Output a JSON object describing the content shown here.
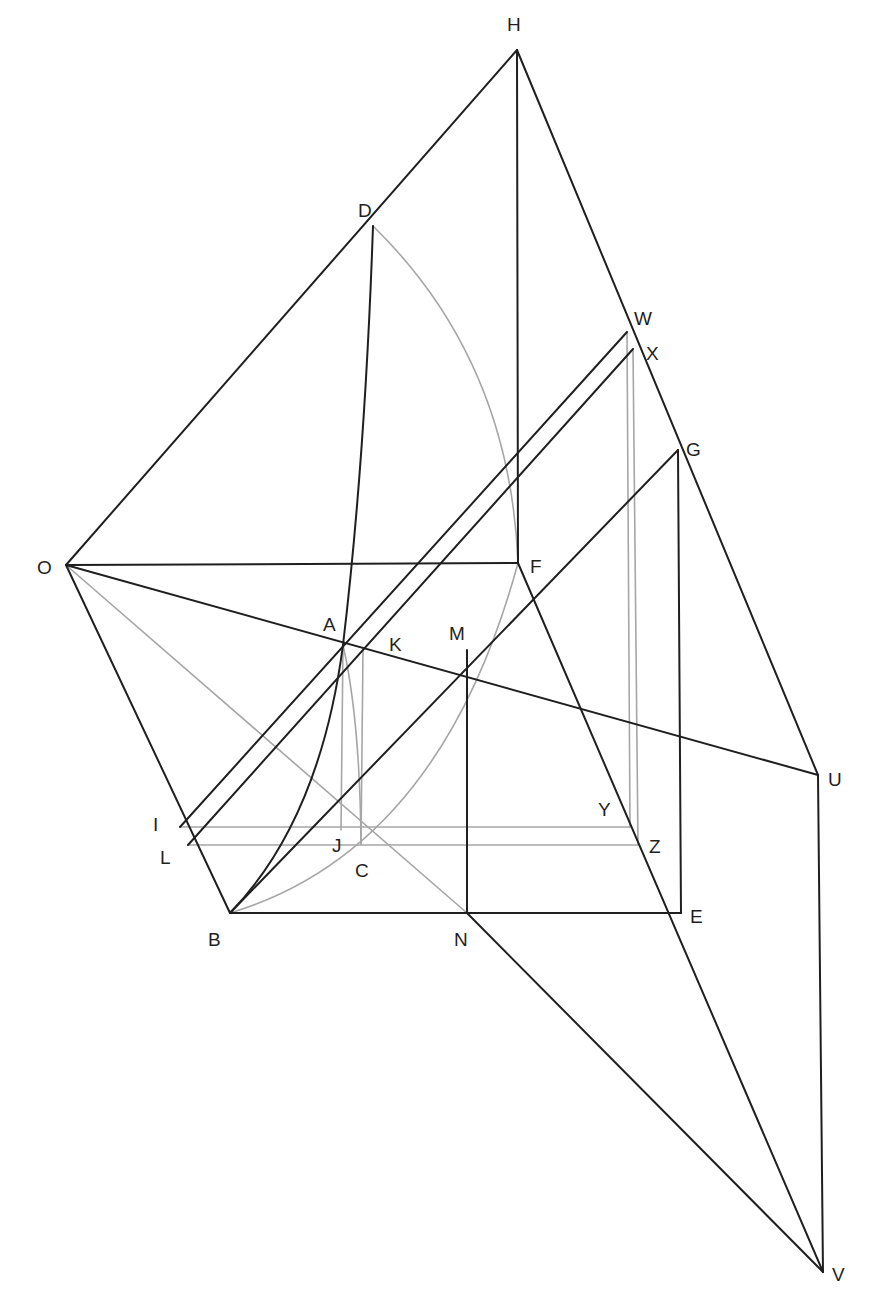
{
  "diagram": {
    "title": "",
    "colors": {
      "primary_line": "#1f1f1f",
      "construction_line": "#a6a6a6",
      "background": "#ffffff"
    },
    "points": {
      "H": {
        "label": "H",
        "x": 517,
        "y": 50
      },
      "D": {
        "label": "D",
        "x": 373,
        "y": 226
      },
      "W": {
        "label": "W",
        "x": 627,
        "y": 332
      },
      "X": {
        "label": "X",
        "x": 633,
        "y": 349
      },
      "G": {
        "label": "G",
        "x": 678,
        "y": 450
      },
      "O": {
        "label": "O",
        "x": 66,
        "y": 565
      },
      "F": {
        "label": "F",
        "x": 518,
        "y": 563
      },
      "A": {
        "label": "A",
        "x": 343,
        "y": 645
      },
      "K": {
        "label": "K",
        "x": 363,
        "y": 650
      },
      "M": {
        "label": "M",
        "x": 467,
        "y": 650
      },
      "U": {
        "label": "U",
        "x": 818,
        "y": 775
      },
      "I": {
        "label": "I",
        "x": 180,
        "y": 827
      },
      "Y": {
        "label": "Y",
        "x": 630,
        "y": 827
      },
      "L": {
        "label": "L",
        "x": 188,
        "y": 845
      },
      "J": {
        "label": "J",
        "x": 341,
        "y": 830
      },
      "C": {
        "label": "C",
        "x": 361,
        "y": 844
      },
      "Z": {
        "label": "Z",
        "x": 638,
        "y": 845
      },
      "B": {
        "label": "B",
        "x": 230,
        "y": 913
      },
      "N": {
        "label": "N",
        "x": 467,
        "y": 913
      },
      "E": {
        "label": "E",
        "x": 681,
        "y": 913
      },
      "V": {
        "label": "V",
        "x": 823,
        "y": 1272
      }
    },
    "labels": [
      {
        "id": "H",
        "text": "H",
        "x": 507,
        "y": 31
      },
      {
        "id": "D",
        "text": "D",
        "x": 358,
        "y": 217
      },
      {
        "id": "W",
        "text": "W",
        "x": 634,
        "y": 325
      },
      {
        "id": "X",
        "text": "X",
        "x": 646,
        "y": 360
      },
      {
        "id": "G",
        "text": "G",
        "x": 686,
        "y": 456
      },
      {
        "id": "O",
        "text": "O",
        "x": 37,
        "y": 574
      },
      {
        "id": "F",
        "text": "F",
        "x": 530,
        "y": 573
      },
      {
        "id": "A",
        "text": "A",
        "x": 323,
        "y": 631
      },
      {
        "id": "K",
        "text": "K",
        "x": 389,
        "y": 651
      },
      {
        "id": "M",
        "text": "M",
        "x": 449,
        "y": 640
      },
      {
        "id": "U",
        "text": "U",
        "x": 828,
        "y": 786
      },
      {
        "id": "I",
        "text": "I",
        "x": 153,
        "y": 831
      },
      {
        "id": "Y",
        "text": "Y",
        "x": 598,
        "y": 816
      },
      {
        "id": "L",
        "text": "L",
        "x": 160,
        "y": 864
      },
      {
        "id": "J",
        "text": "J",
        "x": 332,
        "y": 852
      },
      {
        "id": "C",
        "text": "C",
        "x": 355,
        "y": 877
      },
      {
        "id": "Z",
        "text": "Z",
        "x": 649,
        "y": 853
      },
      {
        "id": "B",
        "text": "B",
        "x": 208,
        "y": 946
      },
      {
        "id": "N",
        "text": "N",
        "x": 454,
        "y": 946
      },
      {
        "id": "E",
        "text": "E",
        "x": 690,
        "y": 923
      },
      {
        "id": "V",
        "text": "V",
        "x": 832,
        "y": 1281
      }
    ]
  }
}
